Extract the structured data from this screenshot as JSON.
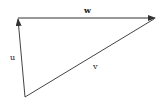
{
  "diagram": {
    "type": "vector-triangle",
    "vectors": [
      {
        "name": "w",
        "label": "w",
        "from": [
          18,
          18
        ],
        "to": [
          155,
          18
        ]
      },
      {
        "name": "u",
        "label": "u",
        "from": [
          25,
          97
        ],
        "to": [
          18,
          18
        ]
      },
      {
        "name": "v",
        "label": "v",
        "from": [
          25,
          97
        ],
        "to": [
          155,
          18
        ]
      }
    ],
    "labels": {
      "w": "w",
      "u": "u",
      "v": "v"
    },
    "colors": {
      "stroke": "#333333",
      "background": "#ffffff"
    }
  }
}
